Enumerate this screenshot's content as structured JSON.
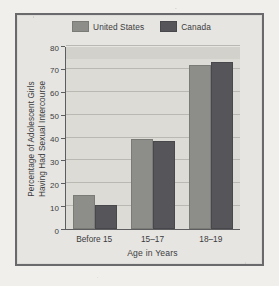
{
  "figure": {
    "legend": {
      "position": "top-center",
      "items": [
        {
          "label": "United States",
          "color": "#8d8d8a",
          "swatch_name": "legend-swatch-united-states"
        },
        {
          "label": "Canada",
          "color": "#55555a",
          "swatch_name": "legend-swatch-canada"
        }
      ]
    }
  },
  "chart_data": {
    "type": "bar",
    "title": "",
    "subtitle": "",
    "xlabel": "Age in Years",
    "ylabel": "Percentage of Adolescent Girls Having Had Sexual Intercourse",
    "ylabel_line1": "Percentage of Adolescent Girls",
    "ylabel_line2": "Having Had Sexual Intercourse",
    "categories": [
      "Before 15",
      "15–17",
      "18–19"
    ],
    "series": [
      {
        "name": "United States",
        "color": "#8d8d8a",
        "values": [
          14,
          38.5,
          71
        ]
      },
      {
        "name": "Canada",
        "color": "#55555a",
        "values": [
          9.5,
          37.5,
          72
        ]
      }
    ],
    "ylim": [
      0,
      80
    ],
    "yticks": [
      0,
      10,
      20,
      30,
      40,
      50,
      60,
      70,
      80
    ],
    "ytick_labels": [
      "0",
      "10",
      "20",
      "30",
      "40",
      "50",
      "60",
      "70",
      "80"
    ],
    "grid": true,
    "grid_axis": "y",
    "legend_position": "top-center",
    "bar_orientation": "vertical",
    "plot_background": "#dcdbd6",
    "figure_background": "#e6e5e1"
  }
}
